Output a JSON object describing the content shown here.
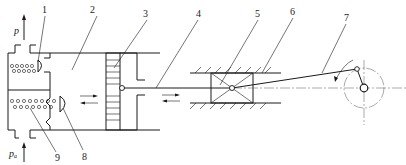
{
  "diagram": {
    "type": "mechanism schematic",
    "labels": [
      {
        "id": "1",
        "text": "1",
        "x": 38,
        "y": 12
      },
      {
        "id": "2",
        "text": "2",
        "x": 90,
        "y": 12
      },
      {
        "id": "3",
        "text": "3",
        "x": 145,
        "y": 16
      },
      {
        "id": "4",
        "text": "4",
        "x": 197,
        "y": 16
      },
      {
        "id": "5",
        "text": "5",
        "x": 256,
        "y": 16
      },
      {
        "id": "6",
        "text": "6",
        "x": 291,
        "y": 14
      },
      {
        "id": "7",
        "text": "7",
        "x": 345,
        "y": 20
      },
      {
        "id": "8",
        "text": "8",
        "x": 84,
        "y": 160
      },
      {
        "id": "9",
        "text": "9",
        "x": 57,
        "y": 161
      }
    ],
    "pressure_labels": {
      "discharge": "p",
      "suction_base": "p",
      "suction_sub": "a"
    }
  }
}
